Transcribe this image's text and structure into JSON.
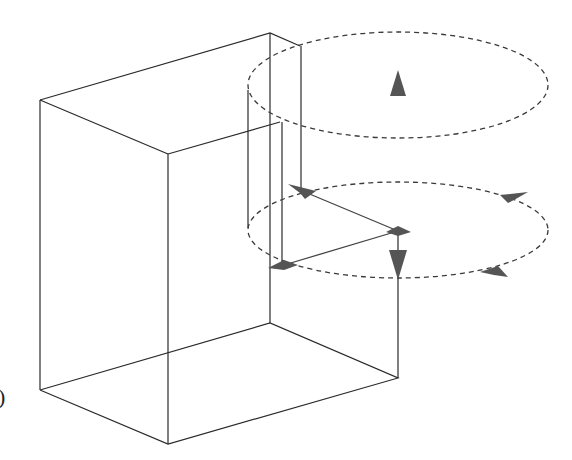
{
  "figure": {
    "edge_label": ")",
    "colors": {
      "line": "#2a2a2a",
      "dashed_ellipse": "#3a3a3a",
      "arrow_fill": "#555555",
      "background": "#ffffff"
    }
  },
  "box": {
    "vertices": {
      "top_left": [
        40,
        100
      ],
      "top_front": [
        168,
        154
      ],
      "top_back": [
        270,
        33
      ],
      "top_right": [
        300,
        46
      ],
      "bottom_left": [
        40,
        390
      ],
      "bottom_front": [
        168,
        444
      ],
      "bottom_back": [
        270,
        323
      ],
      "bottom_right": [
        398,
        378
      ]
    }
  },
  "ellipses": [
    {
      "name": "upper-orbit",
      "cx": 398,
      "cy": 85,
      "rx": 150,
      "ry": 53,
      "style": "dashed"
    },
    {
      "name": "lower-orbit",
      "cx": 398,
      "cy": 230,
      "rx": 150,
      "ry": 48,
      "style": "dashed"
    }
  ],
  "arrows": [
    {
      "name": "up-arrow",
      "direction": "up",
      "position": [
        398,
        82
      ]
    },
    {
      "name": "down-arrow",
      "direction": "down",
      "position": [
        398,
        262
      ]
    },
    {
      "name": "left-top-arrow",
      "direction": "up-left",
      "position": [
        300,
        190
      ]
    },
    {
      "name": "center-node-arrow",
      "direction": "right",
      "position": [
        398,
        231
      ]
    },
    {
      "name": "left-bottom-arrow",
      "direction": "left",
      "position": [
        284,
        265
      ]
    },
    {
      "name": "right-top-arrow",
      "direction": "left",
      "position": [
        512,
        196
      ]
    },
    {
      "name": "right-bottom-arrow",
      "direction": "right",
      "position": [
        494,
        272
      ]
    }
  ]
}
